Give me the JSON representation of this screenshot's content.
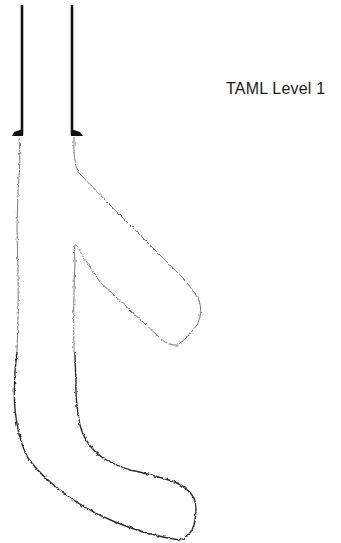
{
  "diagram": {
    "title": "TAML Level 1",
    "type": "multilateral-well-schematic",
    "colors": {
      "casing": "#111111",
      "openhole_lateral": "#7a7a7a",
      "openhole_main": "#2a2a2a",
      "label": "#1a1a1a",
      "background": "#ffffff"
    },
    "elements": [
      {
        "id": "casing-left",
        "kind": "casing string"
      },
      {
        "id": "casing-right",
        "kind": "casing string"
      },
      {
        "id": "casing-shoe-left",
        "kind": "casing shoe"
      },
      {
        "id": "casing-shoe-right",
        "kind": "casing shoe"
      },
      {
        "id": "lateral-branch",
        "kind": "openhole lateral"
      },
      {
        "id": "main-bore",
        "kind": "openhole main bore"
      }
    ]
  }
}
